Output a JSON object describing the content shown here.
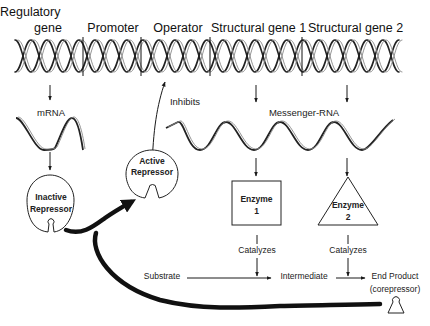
{
  "diagram": {
    "type": "operon-repression",
    "gene_regions": [
      {
        "label_line1": "Regulatory",
        "label_line2": "gene"
      },
      {
        "label": "Promoter"
      },
      {
        "label": "Operator"
      },
      {
        "label": "Structural gene 1"
      },
      {
        "label": "Structural gene 2"
      }
    ],
    "mrna_label": "mRNA",
    "messenger_rna_label": "Messenger-RNA",
    "inhibits_label": "Inhibits",
    "inactive_repressor": {
      "line1": "Inactive",
      "line2": "Repressor"
    },
    "active_repressor": {
      "line1": "Active",
      "line2": "Repressor"
    },
    "enzyme1": {
      "line1": "Enzyme",
      "line2": "1"
    },
    "enzyme2": {
      "line1": "Enzyme",
      "line2": "2"
    },
    "catalyzes1": "Catalyzes",
    "catalyzes2": "Catalyzes",
    "pathway": {
      "substrate": "Substrate",
      "intermediate": "Intermediate",
      "end_product": "End Product",
      "corepressor": "(corepressor)"
    },
    "colors": {
      "line": "#1a1a1a",
      "background": "#ffffff"
    }
  }
}
